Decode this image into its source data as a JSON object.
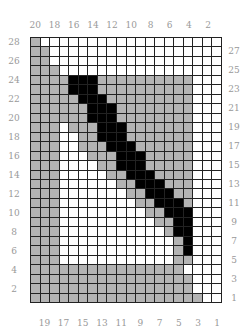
{
  "columns": 20,
  "rows": 28,
  "top_labels": [
    "20",
    "18",
    "16",
    "14",
    "12",
    "10",
    "8",
    "6",
    "4",
    "2"
  ],
  "bottom_labels": [
    "19",
    "17",
    "15",
    "13",
    "11",
    "9",
    "7",
    "5",
    "3",
    "1"
  ],
  "left_labels": [
    "28",
    "26",
    "24",
    "22",
    "20",
    "18",
    "16",
    "14",
    "12",
    "10",
    "8",
    "6",
    "4",
    "2"
  ],
  "right_labels": [
    "27",
    "25",
    "23",
    "21",
    "19",
    "17",
    "15",
    "13",
    "11",
    "9",
    "7",
    "5",
    "3",
    "1"
  ],
  "colors": {
    "white": "#ffffff",
    "gray": "#b3b3b3",
    "black": "#000000",
    "grid": "#222222",
    "label": "#999999"
  },
  "legend_codes": {
    "w": "white",
    "g": "gray",
    "b": "black"
  },
  "grid_rows_top_to_bottom": [
    "gwwwwwwwwwwwwwwwwwww",
    "ggwwwwwwwwwwwwwwwwww",
    "ggwwwwwwwwwwwwwwwwww",
    "gggwwwwwwwwwwwwwwwww",
    "ggggbbbggggggggggwww",
    "ggggbbbggggggggggwww",
    "gggggbbbgggggggggwww",
    "ggggggbbbggggggggwww",
    "ggggggbbbggggggggwww",
    "gggwgggbbbgggggggwww",
    "gggwwggbbbgggggggwww",
    "gggwwgggbbbggggggwww",
    "gggwwwgggbbbgggggwww",
    "gggwwwwggbbbgggggwww",
    "gggwwwwwggbbbggggwww",
    "gggwwwwwwggbbbgggwww",
    "gggwwwwwwwggbbbggwww",
    "gggwwwwwwwwggbbbgwww",
    "gggwwwwwwwwwggbbbwww",
    "gggwwwwwwwwwwggbbwww",
    "gggwwwwwwwwwwwgbbwww",
    "gggwwwwwwwwwwwwgbwww",
    "gggwwwwwwwwwwwwgbwww",
    "gggwwwwwwwwwwwwggwww",
    "ggggggggggggggggwwww",
    "gggggggggggggggggwww",
    "gggggggggggggggggwww",
    "ggggggggggggggggggww"
  ]
}
